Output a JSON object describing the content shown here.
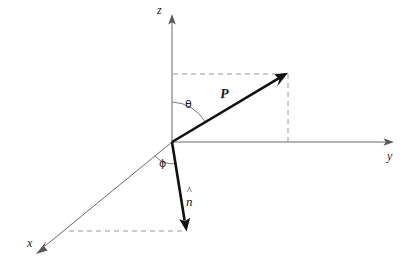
{
  "figure": {
    "kind": "spherical-coordinate-vector-diagram",
    "width": 414,
    "height": 270,
    "background_color": "#ffffff"
  },
  "colors": {
    "axis": "#6b6b6b",
    "vector": "#111111",
    "dashed": "#9a9a9a",
    "arc": "#7a7a7a",
    "text": "#1a1a1a"
  },
  "axes": {
    "origin": {
      "x": 172,
      "y": 142
    },
    "z": {
      "label": "z",
      "from": {
        "x": 172,
        "y": 142
      },
      "to": {
        "x": 172,
        "y": 16
      },
      "label_pos": {
        "x": 157,
        "y": 4
      }
    },
    "y": {
      "label": "y",
      "from": {
        "x": 172,
        "y": 142
      },
      "to": {
        "x": 392,
        "y": 142
      },
      "label_pos": {
        "x": 387,
        "y": 150
      }
    },
    "x": {
      "label": "x",
      "from": {
        "x": 172,
        "y": 142
      },
      "to": {
        "x": 38,
        "y": 252
      },
      "label_pos": {
        "x": 27,
        "y": 237
      }
    }
  },
  "vectors": [
    {
      "name": "position-vector",
      "label": "P",
      "style": "bold-italic",
      "from": {
        "x": 172,
        "y": 142
      },
      "to": {
        "x": 286,
        "y": 74
      },
      "label_pos": {
        "x": 220,
        "y": 87
      }
    },
    {
      "name": "unit-normal-vector",
      "label": "n",
      "accent": "^",
      "style": "italic-with-hat",
      "from": {
        "x": 172,
        "y": 142
      },
      "to": {
        "x": 186,
        "y": 229
      },
      "label_pos": {
        "x": 186,
        "y": 188
      }
    }
  ],
  "angles": [
    {
      "name": "polar-angle",
      "label": "θ",
      "between": [
        "z-axis",
        "position-vector"
      ],
      "radius": 40,
      "label_pos": {
        "x": 185,
        "y": 99
      }
    },
    {
      "name": "azimuthal-angle",
      "label": "ϕ",
      "between": [
        "x-axis",
        "unit-normal-vector"
      ],
      "radius": 22,
      "label_pos": {
        "x": 159,
        "y": 158
      }
    }
  ],
  "projection_lines": [
    {
      "name": "p-horizontal-projection",
      "from": {
        "x": 173,
        "y": 74
      },
      "to": {
        "x": 288,
        "y": 74
      }
    },
    {
      "name": "p-vertical-projection",
      "from": {
        "x": 288,
        "y": 74
      },
      "to": {
        "x": 288,
        "y": 142
      }
    },
    {
      "name": "n-base-projection",
      "from": {
        "x": 69,
        "y": 231
      },
      "to": {
        "x": 186,
        "y": 231
      }
    }
  ]
}
